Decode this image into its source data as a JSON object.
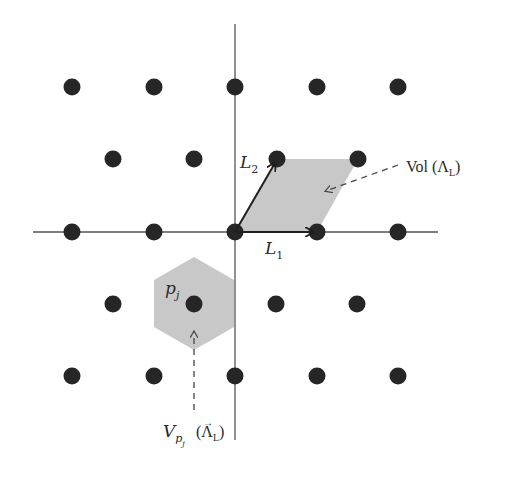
{
  "diagram": {
    "type": "lattice",
    "colors": {
      "background": "#ffffff",
      "dot": "#262626",
      "axis": "#555555",
      "fill": "#c8c8c8",
      "arrow": "#1f1f1f",
      "text": "#2a2a2a"
    },
    "axes": {
      "horizontal": {
        "x1": 33,
        "x2": 438,
        "y": 232
      },
      "vertical": {
        "x": 235,
        "y1": 24,
        "y2": 440
      }
    },
    "lattice_points": [
      [
        72,
        87
      ],
      [
        154,
        87
      ],
      [
        235,
        87
      ],
      [
        317,
        87
      ],
      [
        398,
        87
      ],
      [
        113,
        159
      ],
      [
        194,
        159
      ],
      [
        277,
        159
      ],
      [
        358,
        159
      ],
      [
        72,
        232
      ],
      [
        154,
        232
      ],
      [
        235,
        232
      ],
      [
        317,
        232
      ],
      [
        398,
        232
      ],
      [
        113,
        304
      ],
      [
        194,
        304
      ],
      [
        276,
        304
      ],
      [
        357,
        304
      ],
      [
        72,
        376
      ],
      [
        154,
        376
      ],
      [
        235,
        376
      ],
      [
        317,
        376
      ],
      [
        398,
        376
      ]
    ],
    "fundamental_parallelogram": {
      "points": "235,232 317,232 358,159 277,159"
    },
    "voronoi_cell": {
      "points": "194,257 234,280 234,327 194,350 154,327 154,280"
    },
    "vectors": {
      "L1": {
        "x1": 235,
        "y1": 232,
        "x2": 313,
        "y2": 232
      },
      "L2": {
        "x1": 235,
        "y1": 232,
        "x2": 275,
        "y2": 163
      }
    },
    "labels": {
      "L1": {
        "base": "L",
        "sub": "1"
      },
      "L2": {
        "base": "L",
        "sub": "2"
      },
      "pj": {
        "base": "p",
        "sub": "j"
      },
      "vol": {
        "prefix": "Vol (",
        "lambda": "Λ",
        "sub": "L",
        "suffix": ")"
      },
      "voronoi": {
        "base": "V",
        "sub": "p",
        "subsub": "j",
        "paren_open": "(",
        "vec": "Λ",
        "vec_arrow": "→",
        "vec_sub": "L",
        "paren_close": ")"
      }
    }
  }
}
